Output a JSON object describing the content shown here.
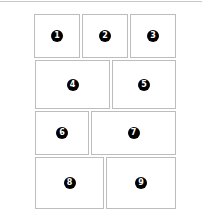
{
  "layout": {
    "panels": [
      {
        "label": "1"
      },
      {
        "label": "2"
      },
      {
        "label": "3"
      },
      {
        "label": "4"
      },
      {
        "label": "5"
      },
      {
        "label": "6"
      },
      {
        "label": "7"
      },
      {
        "label": "8"
      },
      {
        "label": "9"
      }
    ]
  },
  "colors": {
    "border": "#bdbdbd",
    "badge": "#000000",
    "badge_text": "#ffffff"
  }
}
